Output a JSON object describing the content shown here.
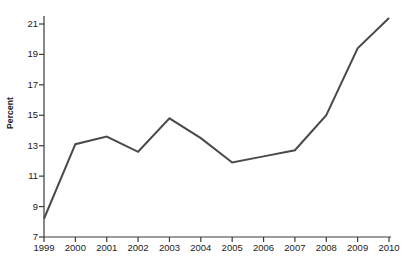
{
  "chart_data": {
    "type": "line",
    "title": "",
    "cropped_title_fragment": "",
    "xlabel": "",
    "ylabel": "Percent",
    "categories": [
      "1999",
      "2000",
      "2001",
      "2002",
      "2003",
      "2004",
      "2005",
      "2006",
      "2007",
      "2008",
      "2009",
      "2010"
    ],
    "x": [
      1999,
      2000,
      2001,
      2002,
      2003,
      2004,
      2005,
      2006,
      2007,
      2008,
      2009,
      2010
    ],
    "values": [
      8.2,
      13.1,
      13.6,
      12.6,
      14.8,
      13.5,
      11.9,
      12.3,
      12.7,
      15.0,
      19.4,
      21.4
    ],
    "series": [
      {
        "name": "Percent",
        "values": [
          8.2,
          13.1,
          13.6,
          12.6,
          14.8,
          13.5,
          11.9,
          12.3,
          12.7,
          15.0,
          19.4,
          21.4
        ]
      }
    ],
    "ylim": [
      7,
      21
    ],
    "yticks": [
      7,
      9,
      11,
      13,
      15,
      17,
      19,
      21
    ],
    "ytick_labels": [
      "7",
      "9",
      "11",
      "13",
      "15",
      "17",
      "19",
      "21"
    ],
    "xtick_labels": [
      "1999",
      "2000",
      "2001",
      "2002",
      "2003",
      "2004",
      "2005",
      "2006",
      "2007",
      "2008",
      "2009",
      "2010"
    ],
    "grid": false,
    "legend": null,
    "legend_position": "none",
    "line_color": "#4a4a4a",
    "axis_color": "#3a3a3a",
    "markers": false,
    "line_width": 2
  }
}
